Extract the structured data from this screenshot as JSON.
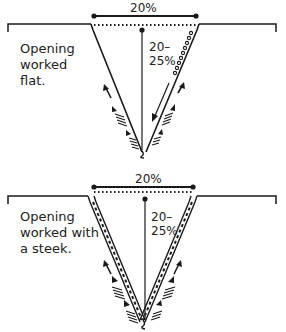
{
  "diagrams": [
    {
      "id": "flat",
      "width_label": "20%",
      "depth_label": "20–\n25%",
      "caption": "Opening\nworked\nflat."
    },
    {
      "id": "steek",
      "width_label": "20%",
      "depth_label": "20–\n25%",
      "caption": "Opening\nworked with\na steek."
    }
  ],
  "colors": {
    "ink": "#1a1a1a",
    "background": "#ffffff"
  }
}
